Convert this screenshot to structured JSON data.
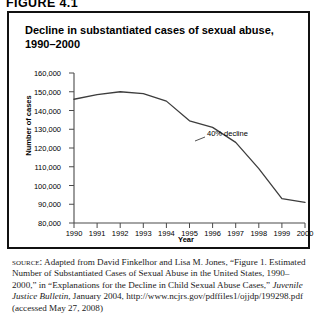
{
  "figure": {
    "number_label": "FIGURE 4.1",
    "title": "Decline in substantiated cases of sexual abuse, 1990–2000"
  },
  "chart_data": {
    "type": "line",
    "title": "Decline in substantiated cases of sexual abuse, 1990–2000",
    "xlabel": "Year",
    "ylabel": "Number of cases",
    "categories": [
      "1990",
      "1991",
      "1992",
      "1993",
      "1994",
      "1995",
      "1996",
      "1997",
      "1998",
      "1999",
      "2000"
    ],
    "x": [
      1990,
      1991,
      1992,
      1993,
      1994,
      1995,
      1996,
      1997,
      1998,
      1999,
      2000
    ],
    "values": [
      146000,
      148500,
      150000,
      149000,
      145000,
      134500,
      131000,
      123000,
      109000,
      93000,
      91000
    ],
    "series": [
      {
        "name": "Substantiated cases of sexual abuse",
        "values": [
          146000,
          148500,
          150000,
          149000,
          145000,
          134500,
          131000,
          123000,
          109000,
          93000,
          91000
        ]
      }
    ],
    "ylim": [
      80000,
      160000
    ],
    "xlim": [
      1990,
      2000
    ],
    "ytick_labels": [
      "160,000",
      "150,000",
      "140,000",
      "130,000",
      "120,000",
      "110,000",
      "100,000",
      "90,000",
      "80,000"
    ],
    "ytick_values": [
      160000,
      150000,
      140000,
      130000,
      120000,
      110000,
      100000,
      90000,
      80000
    ],
    "xtick_labels": [
      "1990",
      "1991",
      "1992",
      "1993",
      "1994",
      "1995",
      "1996",
      "1997",
      "1998",
      "1999",
      "2000"
    ],
    "grid": false,
    "legend": "none",
    "line_color": "#3d3d3d",
    "annotations": [
      {
        "text": "40% decline",
        "x": 1996.0,
        "y": 128000
      }
    ]
  },
  "source": {
    "label": "source:",
    "text_part_1": " Adapted from David Finkelhor and Lisa M. Jones, “Figure 1. Estimated Number of Substantiated Cases of Sexual Abuse in the United States, 1990–2000,” in “Explanations for the Decline in Child Sexual Abuse Cases,” ",
    "italic_title": "Juvenile Justice Bulletin",
    "text_part_2": ", January 2004, http://www.ncjrs.gov/pdffiles1/ojjdp/199298.pdf (accessed May 27, 2008)"
  }
}
